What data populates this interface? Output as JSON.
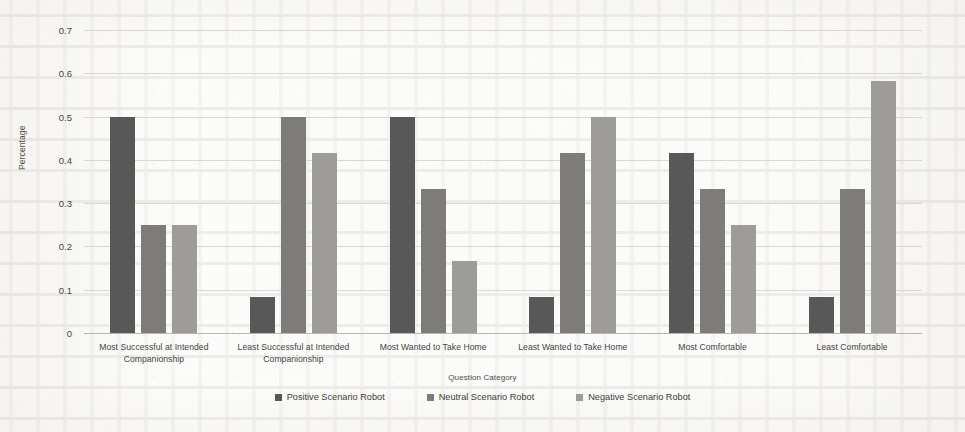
{
  "chart_data": {
    "type": "bar",
    "title": "",
    "xlabel": "Question Category",
    "ylabel": "Percentage",
    "ylim": [
      0,
      0.7
    ],
    "ytick_labels": [
      "0.7",
      "0.6",
      "0.5",
      "0.4",
      "0.3",
      "0.2",
      "0.1",
      "0"
    ],
    "ytick_values": [
      0.7,
      0.6,
      0.5,
      0.4,
      0.3,
      0.2,
      0.1,
      0
    ],
    "grid": true,
    "legend_position": "bottom",
    "categories": [
      "Most Successful at Intended Companionship",
      "Least Successful at Intended Companionship",
      "Most Wanted to Take Home",
      "Least Wanted to Take Home",
      "Most Comfortable",
      "Least Comfortable"
    ],
    "category_lines": [
      [
        "Most Successful at Intended",
        "Companionship"
      ],
      [
        "Least Successful at Intended",
        "Companionship"
      ],
      [
        "Most Wanted to Take Home"
      ],
      [
        "Least Wanted to Take Home"
      ],
      [
        "Most Comfortable"
      ],
      [
        "Least Comfortable"
      ]
    ],
    "series": [
      {
        "name": "Positive Scenario Robot",
        "color": "#595858",
        "values": [
          0.5,
          0.083,
          0.5,
          0.083,
          0.417,
          0.083
        ]
      },
      {
        "name": "Neutral Scenario Robot",
        "color": "#7d7c7b",
        "values": [
          0.25,
          0.5,
          0.333,
          0.417,
          0.333,
          0.333
        ]
      },
      {
        "name": "Negative Scenario Robot",
        "color": "#9d9c9b",
        "values": [
          0.25,
          0.417,
          0.167,
          0.5,
          0.25,
          0.583
        ]
      }
    ]
  }
}
